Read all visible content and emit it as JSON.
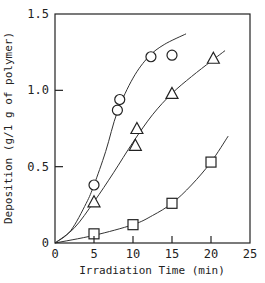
{
  "chart_data": {
    "type": "scatter",
    "title": "",
    "xlabel": "Irradiation Time (min)",
    "ylabel": "Deposition (g/1 g of polymer)",
    "xlim": [
      0,
      25
    ],
    "ylim": [
      0,
      1.5
    ],
    "xticks": [
      0,
      5,
      10,
      15,
      20,
      25
    ],
    "yticks": [
      0,
      0.5,
      1.0,
      1.5
    ],
    "xtick_labels": [
      "0",
      "5",
      "10",
      "15",
      "20",
      "25"
    ],
    "ytick_labels": [
      "0",
      "0.5",
      "1.0",
      "1.5"
    ],
    "grid": false,
    "legend": null,
    "series": [
      {
        "name": "circle",
        "marker": "circle",
        "points": [
          [
            5,
            0.38
          ],
          [
            8,
            0.87
          ],
          [
            8.3,
            0.94
          ],
          [
            12.3,
            1.22
          ],
          [
            15,
            1.23
          ]
        ],
        "curve": [
          [
            0,
            0
          ],
          [
            2,
            0.08
          ],
          [
            4,
            0.26
          ],
          [
            5,
            0.38
          ],
          [
            6.5,
            0.6
          ],
          [
            8,
            0.86
          ],
          [
            10,
            1.08
          ],
          [
            12,
            1.22
          ],
          [
            14,
            1.3
          ],
          [
            16.8,
            1.37
          ]
        ]
      },
      {
        "name": "triangle",
        "marker": "triangle",
        "points": [
          [
            5,
            0.27
          ],
          [
            10.3,
            0.64
          ],
          [
            10.5,
            0.75
          ],
          [
            15,
            0.98
          ],
          [
            20.3,
            1.21
          ]
        ],
        "curve": [
          [
            0,
            0
          ],
          [
            2.5,
            0.1
          ],
          [
            5,
            0.27
          ],
          [
            7.5,
            0.46
          ],
          [
            10,
            0.66
          ],
          [
            12.5,
            0.84
          ],
          [
            15,
            0.98
          ],
          [
            17.5,
            1.09
          ],
          [
            20,
            1.19
          ],
          [
            21.8,
            1.26
          ]
        ]
      },
      {
        "name": "square",
        "marker": "square",
        "points": [
          [
            5,
            0.06
          ],
          [
            10,
            0.12
          ],
          [
            15,
            0.26
          ],
          [
            20,
            0.53
          ]
        ],
        "curve": [
          [
            0,
            0
          ],
          [
            5,
            0.05
          ],
          [
            10,
            0.12
          ],
          [
            12.5,
            0.18
          ],
          [
            15,
            0.26
          ],
          [
            17.5,
            0.38
          ],
          [
            20,
            0.53
          ],
          [
            22.2,
            0.7
          ]
        ]
      }
    ]
  }
}
